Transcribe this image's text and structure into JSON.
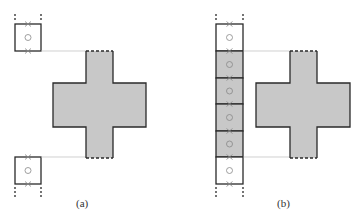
{
  "figure": {
    "panels": [
      {
        "id": "a",
        "label": "(a)",
        "description": "Two isolated cells (top and bottom) aligned with the ends of a cross-shaped domain",
        "cells": [
          {
            "position": "top",
            "fill": "white",
            "marker_center": "circle",
            "marker_edges": "cross"
          },
          {
            "position": "bottom",
            "fill": "white",
            "marker_center": "circle",
            "marker_edges": "cross"
          }
        ],
        "cross": {
          "fill": "#c8c8c8",
          "dashed_ends": [
            "top",
            "bottom"
          ]
        }
      },
      {
        "id": "b",
        "label": "(b)",
        "description": "A column of six cells; the middle four are shaded, the end cells are white, next to a cross-shaped domain",
        "cells": [
          {
            "index": 0,
            "fill": "white"
          },
          {
            "index": 1,
            "fill": "shaded"
          },
          {
            "index": 2,
            "fill": "shaded"
          },
          {
            "index": 3,
            "fill": "shaded"
          },
          {
            "index": 4,
            "fill": "shaded"
          },
          {
            "index": 5,
            "fill": "white"
          }
        ],
        "cross": {
          "fill": "#c8c8c8",
          "dashed_ends": [
            "top",
            "bottom"
          ]
        }
      }
    ],
    "colors": {
      "shade": "#c8c8c8",
      "stroke": "#2a2a2a",
      "marker": "#888888",
      "guide": "#bbbbbb"
    }
  }
}
